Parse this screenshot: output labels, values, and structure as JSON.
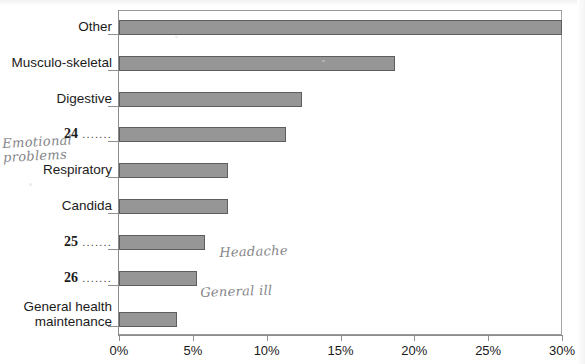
{
  "chart_data": {
    "type": "bar",
    "orientation": "horizontal",
    "title": "",
    "xlabel": "",
    "ylabel": "",
    "xlim": [
      0,
      30
    ],
    "xticks": [
      "0%",
      "5%",
      "10%",
      "15%",
      "20%",
      "25%",
      "30%"
    ],
    "xtick_values": [
      0,
      5,
      10,
      15,
      20,
      25,
      30
    ],
    "grid": false,
    "legend": "none",
    "categories": [
      "Other",
      "Musculo-skeletal",
      "Digestive",
      "24 .......",
      "Respiratory",
      "Candida",
      "25 .......",
      "26 .......",
      "General health\nmaintenance"
    ],
    "values": [
      30.0,
      18.7,
      12.4,
      11.3,
      7.4,
      7.4,
      5.8,
      5.3,
      3.9
    ],
    "bar_color": "#969696",
    "bar_border_color": "#5e5e5e"
  },
  "chart": {
    "rows": [
      {
        "label": "Other",
        "numbered": false,
        "leader": "",
        "value": 30.0
      },
      {
        "label": "Musculo-skeletal",
        "numbered": false,
        "leader": "",
        "value": 18.7
      },
      {
        "label": "Digestive",
        "numbered": false,
        "leader": "",
        "value": 12.4
      },
      {
        "label": "24",
        "numbered": true,
        "leader": ".......",
        "value": 11.3
      },
      {
        "label": "Respiratory",
        "numbered": false,
        "leader": "",
        "value": 7.4
      },
      {
        "label": "Candida",
        "numbered": false,
        "leader": "",
        "value": 7.4
      },
      {
        "label": "25",
        "numbered": true,
        "leader": ".......",
        "value": 5.8
      },
      {
        "label": "26",
        "numbered": true,
        "leader": ".......",
        "value": 5.3
      },
      {
        "label": "General health\nmaintenance",
        "numbered": false,
        "leader": "",
        "value": 3.9
      }
    ],
    "xticks": [
      {
        "label": "0%",
        "value": 0
      },
      {
        "label": "5%",
        "value": 5
      },
      {
        "label": "10%",
        "value": 10
      },
      {
        "label": "15%",
        "value": 15
      },
      {
        "label": "20%",
        "value": 20
      },
      {
        "label": "25%",
        "value": 25
      },
      {
        "label": "30%",
        "value": 30
      }
    ]
  },
  "annotations": {
    "emotional": "Emotional\n   problems",
    "headache": "Headache",
    "general_ill": "General ill"
  }
}
